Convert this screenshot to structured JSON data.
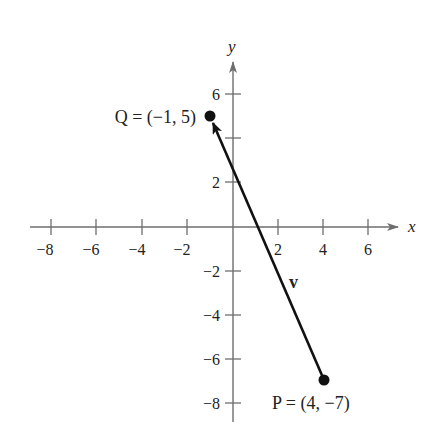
{
  "diagram": {
    "type": "coordinate-plane-vector",
    "axes": {
      "x_label": "x",
      "y_label": "y",
      "x_ticks": [
        {
          "value": -8,
          "label": "−8"
        },
        {
          "value": -6,
          "label": "−6"
        },
        {
          "value": -4,
          "label": "−4"
        },
        {
          "value": -2,
          "label": "−2"
        },
        {
          "value": 2,
          "label": "2"
        },
        {
          "value": 4,
          "label": "4"
        },
        {
          "value": 6,
          "label": "6"
        }
      ],
      "y_ticks": [
        {
          "value": 6,
          "label": "6"
        },
        {
          "value": 4,
          "label": ""
        },
        {
          "value": 2,
          "label": "2"
        },
        {
          "value": -2,
          "label": "−2"
        },
        {
          "value": -4,
          "label": "−4"
        },
        {
          "value": -6,
          "label": "−6"
        },
        {
          "value": -8,
          "label": "−8"
        }
      ]
    },
    "points": {
      "Q": {
        "name": "Q",
        "x": -1,
        "y": 5,
        "label": "Q = (−1, 5)"
      },
      "P": {
        "name": "P",
        "x": 4,
        "y": -7,
        "label": "P = (4, −7)"
      }
    },
    "vector": {
      "name": "v",
      "label": "v",
      "from": "P",
      "to": "Q"
    },
    "colors": {
      "axis": "#6e6e6e",
      "vector": "#111111",
      "text": "#222222"
    }
  }
}
